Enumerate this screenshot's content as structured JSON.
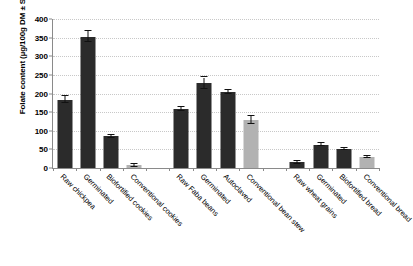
{
  "chart_data": {
    "type": "bar",
    "title": "",
    "xlabel": "",
    "ylabel": "Folate content (µg/100g DM ± SD)",
    "ylim": [
      0,
      400
    ],
    "ytick_step": 50,
    "yticks": [
      "0",
      "50",
      "100",
      "150",
      "200",
      "250",
      "300",
      "350",
      "400"
    ],
    "grid": true,
    "legend": "none",
    "colors": {
      "dark_bar": "#2b2b2b",
      "light_bar": "#b2b2b2",
      "axis": "#8a8a8a",
      "gridline": "#c8c8c8",
      "error_bar": "#111111"
    },
    "groups": [
      {
        "name": "Chickpea",
        "category_count": 4
      },
      {
        "name": "Faba beans",
        "category_count": 4
      },
      {
        "name": "Wheat",
        "category_count": 4
      }
    ],
    "categories": [
      "Raw chickpea",
      "Germinated",
      "Biofortified cookies",
      "Conventional cookies",
      "Raw Faba beans",
      "Germinated",
      "Autoclaved",
      "Conventional bean stew",
      "Raw wheat grains",
      "Germinated",
      "Biofortified bread",
      "Conventional bread"
    ],
    "values": [
      183,
      353,
      85,
      7,
      158,
      228,
      205,
      128,
      15,
      63,
      52,
      30
    ],
    "errors": [
      9,
      14,
      4,
      3,
      6,
      15,
      5,
      11,
      3,
      3,
      3,
      3
    ],
    "shades": [
      "dark",
      "dark",
      "dark",
      "light",
      "dark",
      "dark",
      "dark",
      "light",
      "dark",
      "dark",
      "dark",
      "light"
    ],
    "slot_index": [
      0,
      1,
      2,
      3,
      5,
      6,
      7,
      8,
      10,
      11,
      12,
      13
    ],
    "total_slots": 14
  }
}
